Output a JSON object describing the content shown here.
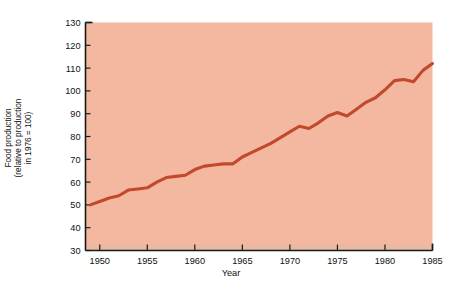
{
  "figure": {
    "marker": ")",
    "background_color": "#ffffff",
    "plot_background_color": "#f4b8a1",
    "line_color": "#c2492b",
    "axis_color": "#1a1a1a",
    "text_color": "#111111"
  },
  "chart_data": {
    "type": "line",
    "title": "",
    "xlabel": "Year",
    "ylabel": "Food production\n(relative to production\nin 1976 = 100)",
    "ylabel_lines": [
      "Food production",
      "(relative to production",
      "in 1976 = 100)"
    ],
    "xlim": [
      1948.5,
      1985
    ],
    "ylim": [
      30,
      130
    ],
    "xticks": [
      1950,
      1955,
      1960,
      1965,
      1970,
      1975,
      1980,
      1985
    ],
    "xtick_labels": [
      "1950",
      "1955",
      "1960",
      "1965",
      "1970",
      "1975",
      "1980",
      "1985"
    ],
    "yticks": [
      30,
      40,
      50,
      60,
      70,
      80,
      90,
      100,
      110,
      120,
      130
    ],
    "ytick_labels": [
      "30",
      "40",
      "50",
      "60",
      "70",
      "80",
      "90",
      "100",
      "110",
      "120",
      "130"
    ],
    "grid": false,
    "legend": false,
    "series": [
      {
        "name": "Food production index",
        "color": "#c2492b",
        "x": [
          1949,
          1950,
          1951,
          1952,
          1953,
          1954,
          1955,
          1956,
          1957,
          1958,
          1959,
          1960,
          1961,
          1962,
          1963,
          1964,
          1965,
          1966,
          1967,
          1968,
          1969,
          1970,
          1971,
          1972,
          1973,
          1974,
          1975,
          1976,
          1977,
          1978,
          1979,
          1980,
          1981,
          1982,
          1983,
          1984
        ],
        "values": [
          50,
          51.5,
          53,
          54,
          56.5,
          57,
          57.5,
          60,
          62,
          62.5,
          63,
          65.5,
          67,
          67.5,
          68,
          68,
          71,
          73,
          75,
          77,
          79.5,
          82,
          84.5,
          83.5,
          86,
          89,
          90.5,
          89,
          92,
          95,
          97,
          100.5,
          104.5,
          105,
          104,
          109
        ]
      }
    ],
    "line_points": [
      [
        1949,
        50
      ],
      [
        1950,
        51.5
      ],
      [
        1951,
        53
      ],
      [
        1952,
        54
      ],
      [
        1953,
        56.5
      ],
      [
        1954,
        57
      ],
      [
        1955,
        57.5
      ],
      [
        1956,
        60
      ],
      [
        1957,
        62
      ],
      [
        1958,
        62.5
      ],
      [
        1959,
        63
      ],
      [
        1960,
        65.5
      ],
      [
        1961,
        67
      ],
      [
        1962,
        67.5
      ],
      [
        1963,
        68
      ],
      [
        1964,
        68
      ],
      [
        1965,
        71
      ],
      [
        1966,
        73
      ],
      [
        1967,
        75
      ],
      [
        1968,
        77
      ],
      [
        1969,
        79.5
      ],
      [
        1970,
        82
      ],
      [
        1971,
        84.5
      ],
      [
        1972,
        83.5
      ],
      [
        1973,
        86
      ],
      [
        1974,
        89
      ],
      [
        1975,
        90.5
      ],
      [
        1976,
        89
      ],
      [
        1977,
        92
      ],
      [
        1978,
        95
      ],
      [
        1979,
        97
      ],
      [
        1980,
        100.5
      ],
      [
        1981,
        104.5
      ],
      [
        1982,
        105
      ],
      [
        1983,
        104
      ],
      [
        1984,
        109
      ],
      [
        1985,
        112
      ],
      [
        1986,
        111
      ],
      [
        1987,
        116
      ],
      [
        1988,
        121
      ]
    ],
    "start_value": 50,
    "end_value": 121
  }
}
